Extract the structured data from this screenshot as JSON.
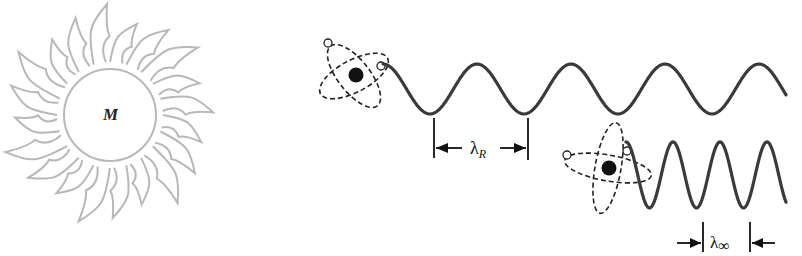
{
  "diagram": {
    "mass_label": "M",
    "star": {
      "center": [
        110,
        115
      ],
      "radius": 47,
      "stroke_color": "#b8b8b8",
      "ray_count": 20
    },
    "upper_atom": {
      "description": "atom emitting photon near mass (redshifted)",
      "nucleus_center": [
        356,
        75
      ],
      "wave": {
        "start_x": 383,
        "end_x": 786,
        "crest_y": 64,
        "trough_y": 114,
        "period_px": 94
      },
      "wavelength_label": "λ",
      "wavelength_subscript": "R",
      "marker_left_x": 434,
      "marker_right_x": 528
    },
    "lower_atom": {
      "description": "atom emitting photon far from mass",
      "nucleus_center": [
        609,
        168
      ],
      "wave": {
        "start_x": 626,
        "end_x": 786,
        "crest_y": 142,
        "trough_y": 208,
        "period_px": 47
      },
      "wavelength_label": "λ",
      "wavelength_subscript": "∞",
      "marker_left_x": 704,
      "marker_right_x": 750
    },
    "colors": {
      "wave": "#3a3a3a",
      "atom": "#222222",
      "star": "#b8b8b8"
    }
  }
}
